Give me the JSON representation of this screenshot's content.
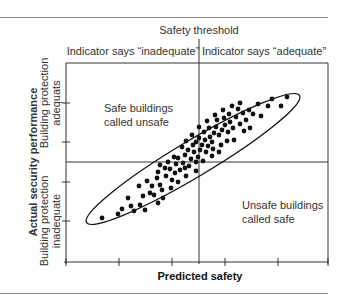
{
  "chart_data": {
    "type": "scatter",
    "title": "",
    "xlabel": "Predicted safety",
    "ylabel": "Actual security performance",
    "threshold_label": "Safety threshold",
    "column_headers": [
      "Indicator says “inadequate”",
      "Indicator says “adequate”"
    ],
    "row_labels": {
      "upper": [
        "Building protection",
        "adequats"
      ],
      "lower": [
        "Building protection",
        "inadequate"
      ]
    },
    "quadrant_annotations": {
      "upper_left": [
        "Safe buildings",
        "called unsafe"
      ],
      "lower_right": [
        "Unsafe buildings",
        "called safe"
      ]
    },
    "grid": false,
    "x_ticks_count": 7,
    "y_ticks_count": 7,
    "envelope": "ellipse enclosing points, positive correlation",
    "points_px": [
      [
        102,
        218
      ],
      [
        118,
        214
      ],
      [
        122,
        209
      ],
      [
        131,
        206
      ],
      [
        128,
        198
      ],
      [
        140,
        205
      ],
      [
        143,
        196
      ],
      [
        139,
        186
      ],
      [
        147,
        181
      ],
      [
        150,
        193
      ],
      [
        152,
        186
      ],
      [
        157,
        178
      ],
      [
        160,
        185
      ],
      [
        154,
        195
      ],
      [
        162,
        190
      ],
      [
        158,
        172
      ],
      [
        166,
        176
      ],
      [
        170,
        169
      ],
      [
        165,
        168
      ],
      [
        172,
        180
      ],
      [
        175,
        173
      ],
      [
        176,
        164
      ],
      [
        180,
        170
      ],
      [
        183,
        163
      ],
      [
        168,
        162
      ],
      [
        178,
        158
      ],
      [
        185,
        155
      ],
      [
        189,
        166
      ],
      [
        191,
        159
      ],
      [
        194,
        152
      ],
      [
        196,
        162
      ],
      [
        198,
        157
      ],
      [
        200,
        150
      ],
      [
        188,
        150
      ],
      [
        182,
        147
      ],
      [
        193,
        145
      ],
      [
        196,
        142
      ],
      [
        199,
        138
      ],
      [
        202,
        145
      ],
      [
        205,
        140
      ],
      [
        206,
        152
      ],
      [
        208,
        146
      ],
      [
        210,
        137
      ],
      [
        212,
        142
      ],
      [
        214,
        133
      ],
      [
        204,
        132
      ],
      [
        209,
        128
      ],
      [
        216,
        127
      ],
      [
        219,
        135
      ],
      [
        222,
        130
      ],
      [
        225,
        125
      ],
      [
        217,
        120
      ],
      [
        224,
        118
      ],
      [
        228,
        132
      ],
      [
        230,
        122
      ],
      [
        233,
        128
      ],
      [
        236,
        117
      ],
      [
        240,
        124
      ],
      [
        243,
        113
      ],
      [
        246,
        120
      ],
      [
        249,
        110
      ],
      [
        253,
        114
      ],
      [
        258,
        104
      ],
      [
        261,
        116
      ],
      [
        268,
        106
      ],
      [
        272,
        99
      ],
      [
        281,
        106
      ],
      [
        287,
        97
      ],
      [
        250,
        128
      ],
      [
        244,
        131
      ],
      [
        238,
        109
      ],
      [
        229,
        114
      ],
      [
        221,
        145
      ],
      [
        212,
        156
      ],
      [
        203,
        161
      ],
      [
        196,
        171
      ],
      [
        186,
        176
      ],
      [
        178,
        182
      ],
      [
        171,
        188
      ],
      [
        163,
        198
      ],
      [
        145,
        210
      ],
      [
        134,
        211
      ],
      [
        158,
        203
      ],
      [
        186,
        141
      ],
      [
        192,
        135
      ],
      [
        199,
        127
      ],
      [
        207,
        121
      ],
      [
        215,
        115
      ],
      [
        223,
        110
      ],
      [
        232,
        106
      ],
      [
        240,
        103
      ],
      [
        185,
        168
      ],
      [
        174,
        157
      ],
      [
        160,
        165
      ],
      [
        213,
        149
      ],
      [
        219,
        152
      ],
      [
        227,
        141
      ],
      [
        234,
        140
      ]
    ],
    "axes_px": {
      "left": 66,
      "right": 328,
      "top": 63,
      "bottom": 262,
      "threshold_x": 199,
      "threshold_y": 162
    }
  }
}
